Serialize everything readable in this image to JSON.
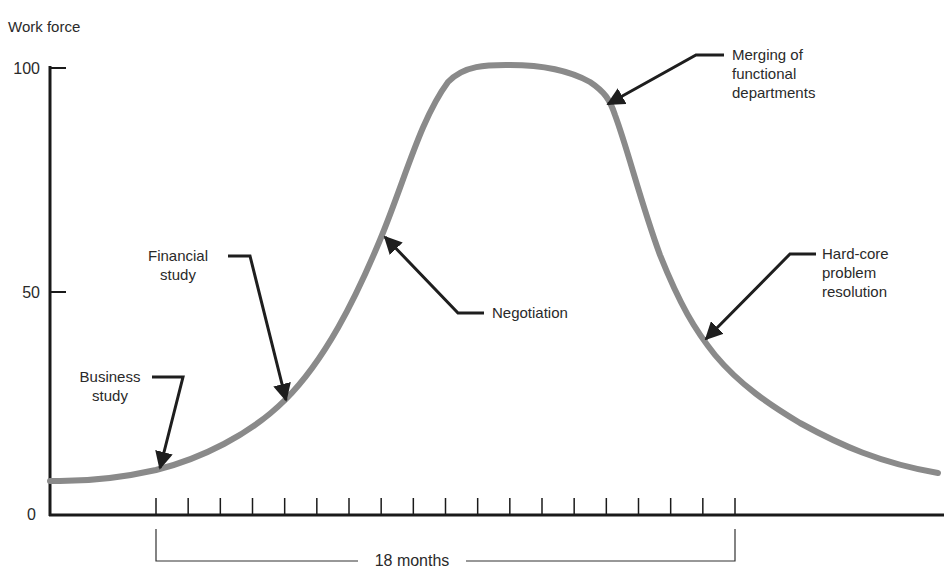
{
  "chart_data": {
    "type": "line",
    "title": "",
    "ylabel": "Work force",
    "xlabel": "",
    "ylim": [
      0,
      100
    ],
    "yticks": [
      "0",
      "50",
      "100"
    ],
    "x_span_label": "18 months",
    "x_tick_count": 19,
    "grid": false,
    "series": [
      {
        "name": "Work force",
        "color": "#8a8a8a",
        "x_months": [
          -3.3,
          0,
          4,
          7,
          8.5,
          11,
          13,
          14,
          15,
          17,
          18.5,
          21.3,
          24
        ],
        "values": [
          7.5,
          10,
          26,
          62,
          94,
          100,
          99,
          93,
          70,
          39,
          27,
          16,
          9.5
        ]
      }
    ],
    "annotations": [
      {
        "label": "Business study",
        "x_month": 0,
        "value": 10
      },
      {
        "label": "Financial study",
        "x_month": 4,
        "value": 26
      },
      {
        "label": "Negotiation",
        "x_month": 7,
        "value": 62
      },
      {
        "label": "Merging of functional departments",
        "x_month": 14,
        "value": 93
      },
      {
        "label": "Hard-core problem resolution",
        "x_month": 17,
        "value": 39
      }
    ]
  },
  "labels": {
    "y_axis_title": "Work force",
    "y100": "100",
    "y50": "50",
    "y0": "0",
    "span": "18 months",
    "business": [
      "Business",
      "study"
    ],
    "financial": [
      "Financial",
      "study"
    ],
    "negotiation": "Negotiation",
    "merging": [
      "Merging of",
      "functional",
      "departments"
    ],
    "hardcore": [
      "Hard-core",
      "problem",
      "resolution"
    ]
  }
}
